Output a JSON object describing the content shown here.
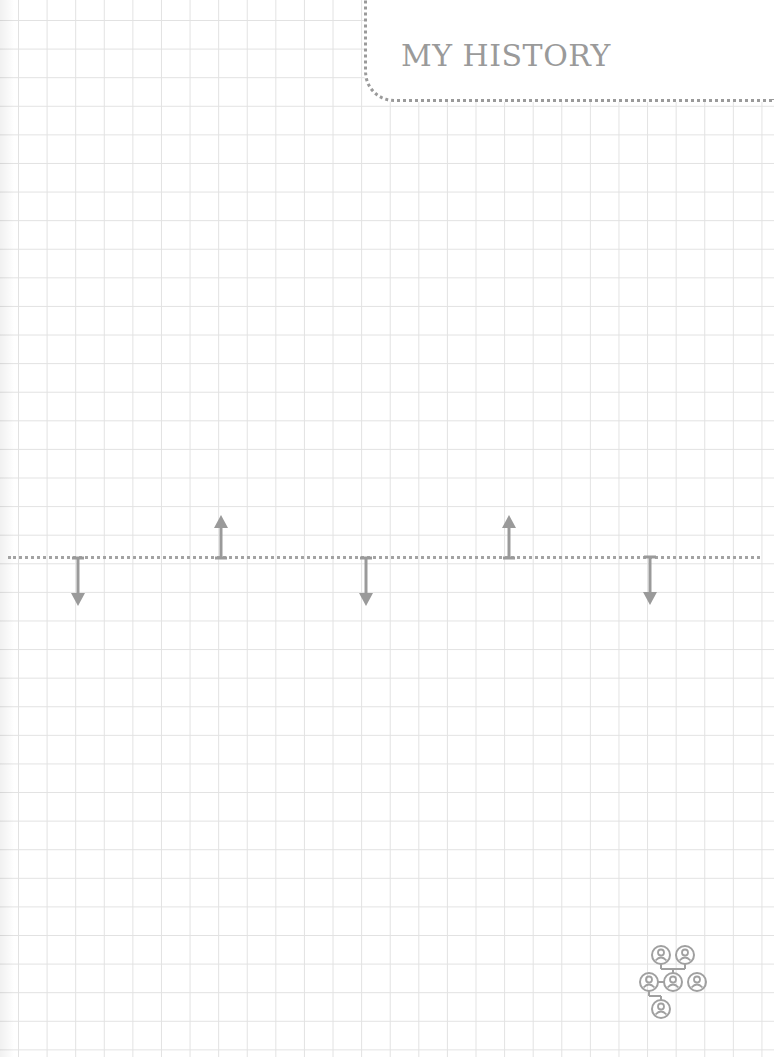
{
  "page": {
    "title": "MY HISTORY",
    "background": "grid-paper"
  },
  "timeline": {
    "line_color": "#a3a3a3",
    "markers": [
      {
        "direction": "down",
        "x": 78
      },
      {
        "direction": "up",
        "x": 221
      },
      {
        "direction": "down",
        "x": 365
      },
      {
        "direction": "up",
        "x": 509
      },
      {
        "direction": "down",
        "x": 650
      }
    ]
  },
  "icons": {
    "family_tree": "family-tree-icon"
  },
  "colors": {
    "ink": "#9a9a9a",
    "grid": "#e2e2e2"
  }
}
